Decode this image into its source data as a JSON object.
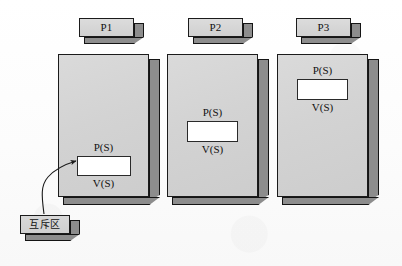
{
  "figure": {
    "background_color": "#fdfdfd",
    "face_color": "#d5d5d5",
    "extrusion_color": "#8e8e8e",
    "outline_color": "#1b1b1b",
    "critical_section_color": "#ffffff"
  },
  "headers": [
    {
      "label": "P1"
    },
    {
      "label": "P2"
    },
    {
      "label": "P3"
    }
  ],
  "processes": [
    {
      "name": "P1",
      "enter_label": "P(S)",
      "exit_label": "V(S)",
      "critical_section_label": ""
    },
    {
      "name": "P2",
      "enter_label": "P(S)",
      "exit_label": "V(S)",
      "critical_section_label": ""
    },
    {
      "name": "P3",
      "enter_label": "P(S)",
      "exit_label": "V(S)",
      "critical_section_label": ""
    }
  ],
  "annotation": {
    "label": "互斥区",
    "points_to": "P1 critical section"
  }
}
